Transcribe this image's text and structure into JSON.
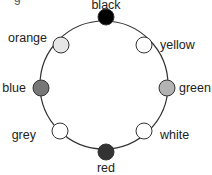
{
  "diagram": {
    "type": "circular-color-ring",
    "top_fragment": "g",
    "ring": {
      "cx": 104,
      "cy": 85,
      "r": 64,
      "stroke": "#333333"
    },
    "nodes": [
      {
        "name": "black",
        "label": "black",
        "fill": "#000000",
        "cx": 106,
        "cy": 17,
        "lx": 106,
        "ly": 9,
        "anchor": "middle"
      },
      {
        "name": "yellow",
        "label": "yellow",
        "fill": "#ffffff",
        "cx": 144,
        "cy": 45,
        "lx": 160,
        "ly": 49,
        "anchor": "start"
      },
      {
        "name": "green",
        "label": "green",
        "fill": "#b3b3b3",
        "cx": 167,
        "cy": 88,
        "lx": 179,
        "ly": 92,
        "anchor": "start"
      },
      {
        "name": "white",
        "label": "white",
        "fill": "#ffffff",
        "cx": 144,
        "cy": 131,
        "lx": 160,
        "ly": 139,
        "anchor": "start"
      },
      {
        "name": "red",
        "label": "red",
        "fill": "#333333",
        "cx": 106,
        "cy": 152,
        "lx": 106,
        "ly": 172,
        "anchor": "middle"
      },
      {
        "name": "grey",
        "label": "grey",
        "fill": "#ffffff",
        "cx": 60,
        "cy": 131,
        "lx": 36,
        "ly": 139,
        "anchor": "end"
      },
      {
        "name": "blue",
        "label": "blue",
        "fill": "#777777",
        "cx": 41,
        "cy": 88,
        "lx": 26,
        "ly": 92,
        "anchor": "end"
      },
      {
        "name": "orange",
        "label": "orange",
        "fill": "#e6e6e6",
        "cx": 61,
        "cy": 45,
        "lx": 47,
        "ly": 42,
        "anchor": "end"
      }
    ],
    "node_radius": 8,
    "node_stroke": "#333333"
  }
}
